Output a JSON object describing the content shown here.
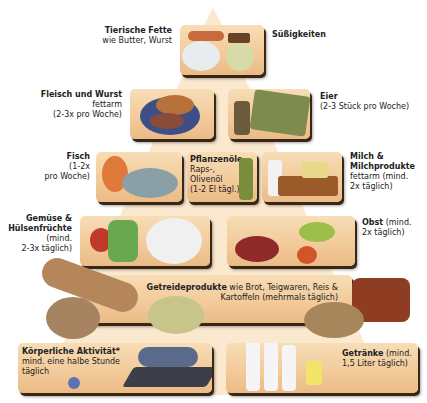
{
  "pyramid": {
    "background_color": "#fbe9cf",
    "box_color": "#f2c999",
    "tiers": [
      {
        "level": 1,
        "items": [
          {
            "id": "tierische-fette",
            "title": "Tierische Fette",
            "detail": "wie Butter, Wurst"
          },
          {
            "id": "suessigkeiten",
            "title": "Süßigkeiten",
            "detail": ""
          }
        ]
      },
      {
        "level": 2,
        "items": [
          {
            "id": "fleisch",
            "title": "Fleisch und Wurst",
            "detail_1": "fettarm",
            "detail_2": "(2-3x pro Woche)"
          },
          {
            "id": "eier",
            "title": "Eier",
            "detail": "(2-3 Stück pro Woche)"
          }
        ]
      },
      {
        "level": 3,
        "items": [
          {
            "id": "fisch",
            "title": "Fisch",
            "detail_1": "(1-2x",
            "detail_2": "pro Woche)"
          },
          {
            "id": "pflanzenoele",
            "title": "Pflanzenöle",
            "detail_1": "Raps-,",
            "detail_2": "Olivenöl",
            "detail_3": "(1-2 El tägl.)"
          },
          {
            "id": "milch",
            "title_1": "Milch &",
            "title_2": "Milchprodukte",
            "detail_1": "fettarm (mind.",
            "detail_2": "2x täglich)"
          }
        ]
      },
      {
        "level": 4,
        "items": [
          {
            "id": "gemuese",
            "title_1": "Gemüse &",
            "title_2": "Hülsenfrüchte",
            "detail_1": "(mind.",
            "detail_2": "2-3x täglich)"
          },
          {
            "id": "obst",
            "title": "Obst",
            "detail_1": "(mind.",
            "detail_2": "2x täglich)"
          }
        ]
      },
      {
        "level": 5,
        "items": [
          {
            "id": "getreide",
            "title": "Getreideprodukte",
            "detail_1": "wie Brot, Teigwaren, Reis &",
            "detail_2": "Kartoffeln (mehrmals täglich)"
          }
        ]
      },
      {
        "level": 6,
        "items": [
          {
            "id": "aktivitaet",
            "title": "Körperliche Aktivität*",
            "detail_1": "mind. eine halbe Stunde",
            "detail_2": "täglich"
          },
          {
            "id": "getraenke",
            "title": "Getränke",
            "detail_1": "(mind.",
            "detail_2": "1,5 Liter täglich)"
          }
        ]
      }
    ]
  }
}
